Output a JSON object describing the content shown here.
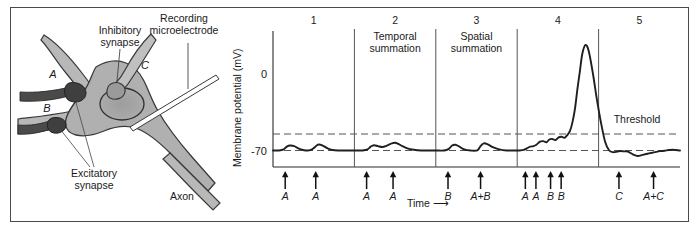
{
  "neuron": {
    "labels": {
      "recording_microelectrode": "Recording\nmicroelectrode",
      "inhibitory_synapse": "Inhibitory\nsynapse",
      "excitatory_synapse": "Excitatory\nsynapse",
      "axon": "Axon",
      "terminal_a": "A",
      "terminal_b": "B",
      "terminal_c": "C"
    },
    "colors": {
      "soma_fill": "#b0b0b0",
      "soma_stroke": "#3a3a3a",
      "nucleus_fill": "#a0a0a0",
      "bouton_fill": "#4a4a4a",
      "axon_fill": "#b8b8b8"
    }
  },
  "chart_data": {
    "type": "line",
    "title": "",
    "xlabel": "Time",
    "ylabel": "Membrane potential (mV)",
    "ytick_labels": [
      "0",
      "-70"
    ],
    "ytick_values": [
      0,
      -70
    ],
    "ylim": [
      -85,
      35
    ],
    "xlim": [
      0,
      100
    ],
    "grid": false,
    "legend": false,
    "annotations": {
      "threshold_label": "Threshold",
      "threshold_value": -55,
      "resting_value": -70,
      "time_arrow": "⟶"
    },
    "panels": [
      {
        "number": "1",
        "label": "",
        "x_start": 0,
        "x_end": 20
      },
      {
        "number": "2",
        "label": "Temporal\nsummation",
        "x_start": 20,
        "x_end": 40
      },
      {
        "number": "3",
        "label": "Spatial\nsummation",
        "x_start": 40,
        "x_end": 60
      },
      {
        "number": "4",
        "label": "",
        "x_start": 60,
        "x_end": 80
      },
      {
        "number": "5",
        "label": "",
        "x_start": 80,
        "x_end": 100
      }
    ],
    "stimuli": [
      {
        "x": 3.0,
        "label": "A",
        "panel": 1
      },
      {
        "x": 10.5,
        "label": "A",
        "panel": 1
      },
      {
        "x": 23.0,
        "label": "A",
        "panel": 2
      },
      {
        "x": 29.5,
        "label": "A",
        "panel": 2
      },
      {
        "x": 43.0,
        "label": "B",
        "panel": 3
      },
      {
        "x": 51.0,
        "label": "A+B",
        "panel": 3
      },
      {
        "x": 62.0,
        "label": "A",
        "panel": 4
      },
      {
        "x": 64.6,
        "label": "A",
        "panel": 4
      },
      {
        "x": 68.2,
        "label": "B",
        "panel": 4
      },
      {
        "x": 70.8,
        "label": "B",
        "panel": 4
      },
      {
        "x": 85.0,
        "label": "C",
        "panel": 5
      },
      {
        "x": 93.5,
        "label": "A+C",
        "panel": 5
      }
    ],
    "series": [
      {
        "name": "Membrane potential",
        "x": [
          0,
          1.5,
          2.6,
          3.4,
          4.2,
          5.2,
          6.2,
          7.4,
          8.6,
          9.6,
          10.4,
          11.2,
          12.2,
          13.4,
          14.6,
          16.0,
          17.6,
          19.2,
          20.6,
          22.0,
          23.2,
          24.0,
          24.8,
          25.8,
          26.8,
          28.0,
          29.2,
          30.0,
          30.8,
          31.8,
          33.0,
          34.6,
          36.4,
          38.2,
          40.0,
          42.0,
          43.2,
          44.0,
          44.8,
          45.8,
          47.0,
          48.6,
          50.2,
          51.0,
          51.8,
          52.8,
          54.0,
          55.6,
          57.4,
          59.2,
          60.6,
          61.6,
          62.4,
          63.2,
          64.0,
          64.8,
          65.6,
          66.4,
          67.2,
          67.9,
          68.6,
          69.4,
          70.2,
          70.9,
          71.6,
          72.3,
          73.0,
          73.6,
          74.2,
          74.8,
          75.4,
          76.0,
          76.8,
          77.6,
          78.6,
          79.6,
          80.6,
          81.6,
          82.6,
          83.6,
          84.6,
          85.4,
          86.2,
          87.2,
          88.4,
          89.6,
          90.8,
          92.0,
          93.2,
          94.2,
          95.2,
          96.2,
          97.2,
          98.2,
          99.0,
          100.0
        ],
        "y": [
          -70,
          -70,
          -69,
          -66.5,
          -65.5,
          -66,
          -68,
          -69.5,
          -70,
          -69,
          -66.5,
          -64.5,
          -65.5,
          -68,
          -69.5,
          -70,
          -70,
          -70,
          -70,
          -70,
          -69,
          -66.5,
          -65.2,
          -66,
          -66.8,
          -65.5,
          -63.5,
          -63,
          -64,
          -66,
          -68,
          -69.3,
          -70,
          -70,
          -70,
          -70,
          -68.5,
          -65.5,
          -64.8,
          -66.5,
          -69,
          -70,
          -69.8,
          -66,
          -63.5,
          -64.5,
          -67,
          -69,
          -70,
          -70,
          -70,
          -69.5,
          -68,
          -66.5,
          -66,
          -64.5,
          -62,
          -61.5,
          -62.5,
          -60,
          -59.5,
          -60.5,
          -58,
          -57.5,
          -58.5,
          -56,
          -52,
          -44,
          -32,
          -14,
          2,
          18,
          26,
          20,
          0,
          -24,
          -45,
          -62,
          -70,
          -71.5,
          -71,
          -70.5,
          -70.8,
          -71,
          -73.5,
          -75,
          -74,
          -73,
          -72,
          -71.2,
          -70.6,
          -70.2,
          -69.6,
          -69.2,
          -69.6,
          -70
        ]
      }
    ]
  }
}
